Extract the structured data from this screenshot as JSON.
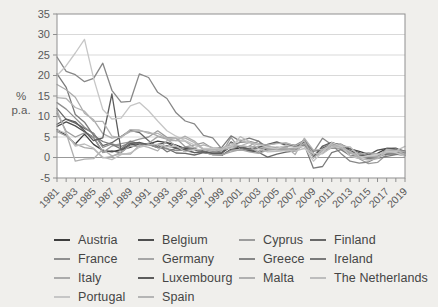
{
  "figure": {
    "background": "#f0efec"
  },
  "axes": {
    "y_unit_lines": [
      "%",
      "p.a."
    ],
    "y_ticks": [
      35,
      30,
      25,
      20,
      15,
      10,
      5,
      0,
      -5
    ],
    "y_min": -5,
    "y_max": 35,
    "x_start": 1981,
    "x_end": 2019,
    "x_label_interval": 2,
    "frame_color": "#8f8f8f",
    "grid_color": "#d9d9d9",
    "zero_line_color": "#999999",
    "tick_label_color": "#5a5a5a"
  },
  "chart_data": {
    "type": "line",
    "title": "",
    "xlabel": "",
    "ylabel": "% p.a.",
    "xlim": [
      1981,
      2019
    ],
    "ylim": [
      -5,
      35
    ],
    "grid": "horizontal",
    "legend_position": "bottom",
    "x": [
      1981,
      1982,
      1983,
      1984,
      1985,
      1986,
      1987,
      1988,
      1989,
      1990,
      1991,
      1992,
      1993,
      1994,
      1995,
      1996,
      1997,
      1998,
      1999,
      2000,
      2001,
      2002,
      2003,
      2004,
      2005,
      2006,
      2007,
      2008,
      2009,
      2010,
      2011,
      2012,
      2013,
      2014,
      2015,
      2016,
      2017,
      2018,
      2019
    ],
    "series": [
      {
        "name": "Austria",
        "color": "#3d3d3d",
        "values": [
          6.8,
          5.4,
          3.3,
          5.7,
          3.2,
          1.7,
          1.4,
          1.9,
          2.5,
          3.3,
          3.3,
          4.0,
          3.6,
          3.0,
          2.2,
          1.9,
          1.2,
          0.8,
          0.5,
          2.0,
          2.3,
          1.7,
          1.3,
          2.0,
          2.1,
          1.7,
          2.2,
          3.2,
          0.4,
          1.7,
          3.6,
          2.6,
          2.1,
          1.5,
          0.8,
          1.0,
          2.2,
          2.1,
          1.5
        ]
      },
      {
        "name": "Belgium",
        "color": "#4f4f4f",
        "values": [
          7.6,
          8.7,
          7.7,
          6.3,
          4.9,
          1.3,
          1.6,
          1.2,
          3.1,
          3.4,
          3.2,
          2.4,
          2.8,
          2.4,
          1.5,
          2.1,
          1.6,
          0.9,
          1.1,
          2.7,
          2.4,
          1.6,
          1.5,
          1.9,
          2.5,
          2.3,
          1.8,
          4.5,
          0.0,
          2.3,
          3.4,
          2.6,
          1.2,
          0.5,
          0.6,
          1.8,
          2.2,
          2.3,
          1.2
        ]
      },
      {
        "name": "Cyprus",
        "color": "#9c9c9c",
        "values": [
          10.8,
          6.4,
          5.0,
          6.0,
          5.0,
          1.2,
          2.8,
          3.4,
          3.8,
          4.5,
          5.0,
          6.5,
          4.9,
          4.7,
          2.6,
          3.0,
          3.6,
          2.2,
          1.1,
          4.9,
          2.0,
          2.8,
          4.0,
          1.9,
          2.0,
          2.2,
          2.2,
          4.4,
          0.2,
          2.6,
          3.5,
          3.1,
          0.4,
          -0.3,
          -1.5,
          -1.2,
          0.7,
          0.8,
          0.5
        ]
      },
      {
        "name": "Finland",
        "color": "#686868",
        "values": [
          12.0,
          9.3,
          8.4,
          7.1,
          5.9,
          2.9,
          3.6,
          5.1,
          6.6,
          6.1,
          4.1,
          2.6,
          2.2,
          1.1,
          1.0,
          0.6,
          1.2,
          1.4,
          1.3,
          2.9,
          2.7,
          2.0,
          1.3,
          0.1,
          0.8,
          1.3,
          1.6,
          3.9,
          1.6,
          1.7,
          3.3,
          3.2,
          2.2,
          1.2,
          -0.2,
          0.4,
          0.8,
          1.2,
          1.1
        ]
      },
      {
        "name": "France",
        "color": "#8f8f8f",
        "values": [
          13.4,
          11.8,
          9.6,
          7.4,
          5.8,
          2.5,
          3.3,
          2.7,
          3.6,
          3.4,
          3.2,
          2.4,
          2.1,
          1.7,
          1.8,
          2.1,
          1.3,
          0.7,
          0.6,
          1.8,
          1.8,
          1.9,
          2.2,
          2.3,
          1.9,
          1.9,
          1.6,
          3.2,
          0.1,
          1.7,
          2.3,
          2.2,
          1.0,
          0.6,
          0.1,
          0.3,
          1.2,
          2.1,
          1.3
        ]
      },
      {
        "name": "Germany",
        "color": "#a6a6a6",
        "values": [
          6.3,
          5.3,
          3.3,
          2.4,
          2.1,
          -0.1,
          0.2,
          1.3,
          2.8,
          2.7,
          3.5,
          5.1,
          4.5,
          2.7,
          1.7,
          1.2,
          1.5,
          0.6,
          0.6,
          1.4,
          1.9,
          1.4,
          1.0,
          1.8,
          1.9,
          1.8,
          2.3,
          2.8,
          0.2,
          1.1,
          2.5,
          2.1,
          1.6,
          0.8,
          0.1,
          0.4,
          1.7,
          1.9,
          1.4
        ]
      },
      {
        "name": "Greece",
        "color": "#878787",
        "values": [
          24.5,
          21.0,
          20.2,
          18.5,
          19.3,
          23.0,
          16.4,
          13.5,
          13.7,
          20.4,
          19.5,
          15.9,
          14.4,
          10.9,
          8.9,
          8.2,
          5.4,
          4.8,
          2.1,
          2.9,
          3.7,
          3.9,
          3.4,
          3.0,
          3.5,
          3.3,
          3.0,
          4.2,
          1.3,
          4.7,
          3.1,
          1.0,
          -0.9,
          -1.4,
          -1.1,
          0.0,
          1.1,
          0.8,
          0.5
        ]
      },
      {
        "name": "Ireland",
        "color": "#7a7a7a",
        "values": [
          20.4,
          17.1,
          10.5,
          8.6,
          5.4,
          3.9,
          3.2,
          2.1,
          4.0,
          3.3,
          3.2,
          3.1,
          1.4,
          2.3,
          2.5,
          2.2,
          1.3,
          2.1,
          2.5,
          5.3,
          4.0,
          4.7,
          4.0,
          2.3,
          2.2,
          2.7,
          2.9,
          3.1,
          -2.6,
          -2.2,
          1.2,
          1.9,
          0.5,
          0.3,
          -0.3,
          -0.2,
          0.3,
          0.7,
          0.9
        ]
      },
      {
        "name": "Italy",
        "color": "#ababab",
        "values": [
          17.8,
          16.5,
          14.7,
          10.8,
          9.2,
          5.8,
          4.7,
          5.1,
          6.3,
          6.5,
          6.2,
          5.3,
          4.6,
          4.1,
          5.2,
          4.0,
          2.0,
          2.0,
          1.7,
          2.6,
          2.8,
          2.6,
          2.7,
          2.3,
          2.2,
          2.2,
          2.0,
          3.5,
          0.8,
          1.6,
          2.9,
          3.3,
          1.3,
          0.2,
          0.1,
          -0.1,
          1.3,
          1.2,
          0.6
        ]
      },
      {
        "name": "Luxembourg",
        "color": "#5c5c5c",
        "values": [
          8.1,
          9.4,
          8.7,
          6.5,
          4.1,
          4.8,
          15.5,
          1.8,
          3.4,
          3.7,
          3.1,
          3.2,
          3.6,
          2.2,
          1.9,
          1.2,
          1.4,
          1.0,
          1.0,
          3.8,
          2.4,
          2.1,
          2.5,
          3.2,
          3.8,
          3.0,
          2.7,
          4.1,
          0.0,
          2.8,
          3.7,
          2.9,
          1.7,
          0.7,
          0.1,
          0.0,
          2.1,
          2.0,
          1.6
        ]
      },
      {
        "name": "Malta",
        "color": "#b0b0b0",
        "values": [
          11.5,
          5.9,
          -0.9,
          -0.4,
          -0.3,
          2.0,
          0.4,
          0.9,
          0.8,
          3.0,
          2.5,
          1.6,
          4.1,
          4.1,
          4.0,
          2.4,
          3.1,
          2.4,
          2.1,
          3.0,
          2.9,
          2.6,
          1.3,
          2.7,
          2.5,
          2.6,
          0.7,
          4.7,
          1.8,
          2.0,
          2.5,
          3.2,
          1.0,
          0.8,
          1.2,
          0.9,
          1.3,
          1.7,
          1.5
        ]
      },
      {
        "name": "The Netherlands",
        "color": "#bdbdbd",
        "values": [
          6.7,
          5.9,
          2.8,
          3.3,
          2.3,
          0.1,
          -0.5,
          0.7,
          1.1,
          2.5,
          3.1,
          3.2,
          2.6,
          2.8,
          1.4,
          2.0,
          1.9,
          1.8,
          2.0,
          2.3,
          5.1,
          3.9,
          2.2,
          1.4,
          1.5,
          1.7,
          1.6,
          2.2,
          1.0,
          0.9,
          2.5,
          2.8,
          2.6,
          0.3,
          0.2,
          0.1,
          1.3,
          1.6,
          2.7
        ]
      },
      {
        "name": "Portugal",
        "color": "#c6c6c6",
        "values": [
          20.0,
          22.4,
          25.5,
          28.8,
          19.3,
          11.7,
          9.4,
          9.6,
          12.6,
          13.4,
          11.4,
          8.9,
          6.5,
          5.2,
          4.1,
          3.1,
          2.2,
          2.2,
          2.2,
          2.8,
          4.4,
          3.7,
          3.3,
          2.5,
          2.1,
          3.0,
          2.4,
          2.7,
          -0.9,
          1.4,
          3.6,
          2.8,
          0.4,
          -0.2,
          0.5,
          0.6,
          1.6,
          1.2,
          0.3
        ]
      },
      {
        "name": "Spain",
        "color": "#b5b5b5",
        "values": [
          14.6,
          14.4,
          12.2,
          11.3,
          8.8,
          8.8,
          5.2,
          4.8,
          6.8,
          6.7,
          5.9,
          5.9,
          4.6,
          4.7,
          4.7,
          3.6,
          1.9,
          1.8,
          2.2,
          3.5,
          2.8,
          3.6,
          3.1,
          3.1,
          3.4,
          3.6,
          2.8,
          4.1,
          -0.2,
          2.0,
          3.2,
          2.4,
          1.5,
          -0.2,
          -0.6,
          -0.3,
          2.0,
          1.7,
          0.8
        ]
      }
    ]
  }
}
